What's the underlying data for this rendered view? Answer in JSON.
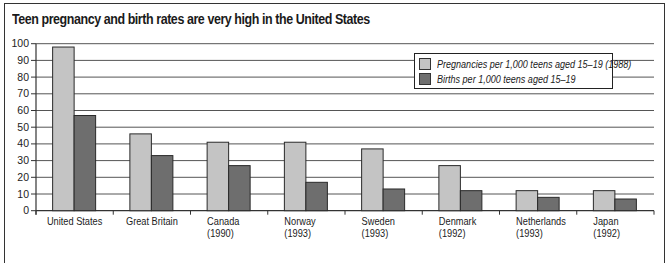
{
  "chart_data": {
    "type": "bar",
    "title": "Teen pregnancy and birth rates are very high in the United States",
    "xlabel": "",
    "ylabel": "",
    "ylim": [
      0,
      100
    ],
    "yticks": [
      0,
      10,
      20,
      30,
      40,
      50,
      60,
      70,
      80,
      90,
      100
    ],
    "grid": true,
    "legend_position": "upper right",
    "categories": [
      {
        "name": "United States",
        "sub": ""
      },
      {
        "name": "Great Britain",
        "sub": ""
      },
      {
        "name": "Canada",
        "sub": "(1990)"
      },
      {
        "name": "Norway",
        "sub": "(1993)"
      },
      {
        "name": "Sweden",
        "sub": "(1993)"
      },
      {
        "name": "Denmark",
        "sub": "(1992)"
      },
      {
        "name": "Netherlands",
        "sub": "(1993)"
      },
      {
        "name": "Japan",
        "sub": "(1992)"
      }
    ],
    "series": [
      {
        "name": "Pregnancies per 1,000 teens aged 15–19 (1988)",
        "color": "#c4c4c4",
        "values": [
          98,
          46,
          41,
          41,
          37,
          27,
          12,
          12
        ]
      },
      {
        "name": "Births per 1,000 teens aged 15–19",
        "color": "#6e6e6e",
        "values": [
          57,
          33,
          27,
          17,
          13,
          12,
          8,
          7
        ]
      }
    ]
  }
}
